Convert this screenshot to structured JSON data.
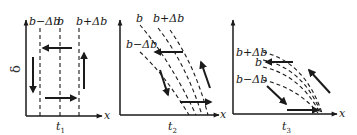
{
  "figure": {
    "y_axis_symbol": "δ",
    "x_axis_symbol": "x",
    "panels": [
      {
        "id": "t1",
        "time_label": "t",
        "time_subscript": "1",
        "curve_labels": [
          "b−Δb",
          "b",
          "b+Δb"
        ],
        "description": "Three vertical dashed lines at b−Δb, b, b+Δb; circulation arrows: left at top, down on left, right at bottom, up on right"
      },
      {
        "id": "t2",
        "time_label": "t",
        "time_subscript": "2",
        "curve_labels": [
          "b",
          "b+Δb",
          "b−Δb"
        ],
        "description": "Dashed curves tilting rightward toward x-axis; arrows left at top, down-right on left, right at bottom, up-left on right"
      },
      {
        "id": "t3",
        "time_label": "t",
        "time_subscript": "3",
        "curve_labels": [
          "b+Δb",
          "b",
          "b−Δb"
        ],
        "description": "Dashed curves converging to a point on the x-axis; arrows left near b, down-right on left, right at bottom, up-left on right"
      }
    ]
  }
}
